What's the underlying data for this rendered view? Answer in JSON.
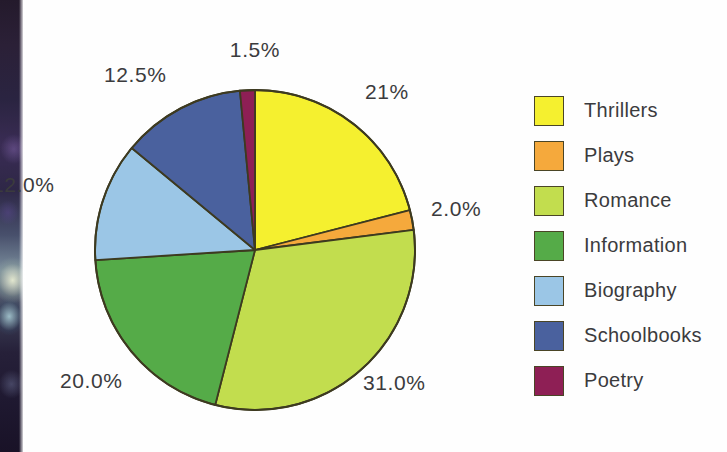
{
  "chart_data": {
    "type": "pie",
    "title": "",
    "subtitle": "",
    "xlabel": "",
    "ylabel": "",
    "legend_position": "right",
    "grid": false,
    "units": "%",
    "start_angle_deg": 0,
    "direction": "clockwise",
    "categories": [
      "Thrillers",
      "Plays",
      "Romance",
      "Information",
      "Biography",
      "Schoolbooks",
      "Poetry"
    ],
    "values": [
      21.0,
      2.0,
      31.0,
      20.0,
      12.0,
      12.5,
      1.5
    ],
    "value_labels": [
      "21%",
      "2.0%",
      "31.0%",
      "20.0%",
      "12.0%",
      "12.5%",
      "1.5%"
    ],
    "colors": [
      "#f5f02f",
      "#f5a93c",
      "#c2dd4e",
      "#55ab48",
      "#9bc6e6",
      "#4a619e",
      "#8e1f55"
    ],
    "slices": [
      {
        "name": "Thrillers",
        "value": 21.0,
        "label": "21%",
        "color": "#f5f02f"
      },
      {
        "name": "Plays",
        "value": 2.0,
        "label": "2.0%",
        "color": "#f5a93c"
      },
      {
        "name": "Romance",
        "value": 31.0,
        "label": "31.0%",
        "color": "#c2dd4e"
      },
      {
        "name": "Information",
        "value": 20.0,
        "label": "20.0%",
        "color": "#55ab48"
      },
      {
        "name": "Biography",
        "value": 12.0,
        "label": "12.0%",
        "color": "#9bc6e6"
      },
      {
        "name": "Schoolbooks",
        "value": 12.5,
        "label": "12.5%",
        "color": "#4a619e"
      },
      {
        "name": "Poetry",
        "value": 1.5,
        "label": "1.5%",
        "color": "#8e1f55"
      }
    ]
  },
  "labels": {
    "thrillers_pct": "21%",
    "plays_pct": "2.0%",
    "romance_pct": "31.0%",
    "information_pct": "20.0%",
    "biography_pct": "12.0%",
    "schoolbooks_pct": "12.5%",
    "poetry_pct": "1.5%"
  },
  "legend": {
    "items": [
      {
        "label": "Thrillers",
        "color": "#f5f02f"
      },
      {
        "label": "Plays",
        "color": "#f5a93c"
      },
      {
        "label": "Romance",
        "color": "#c2dd4e"
      },
      {
        "label": "Information",
        "color": "#55ab48"
      },
      {
        "label": "Biography",
        "color": "#9bc6e6"
      },
      {
        "label": "Schoolbooks",
        "color": "#4a619e"
      },
      {
        "label": "Poetry",
        "color": "#8e1f55"
      }
    ]
  },
  "style": {
    "stroke": "#3d3a20",
    "text_color": "#3b3b3d",
    "background": "#ffffff"
  }
}
